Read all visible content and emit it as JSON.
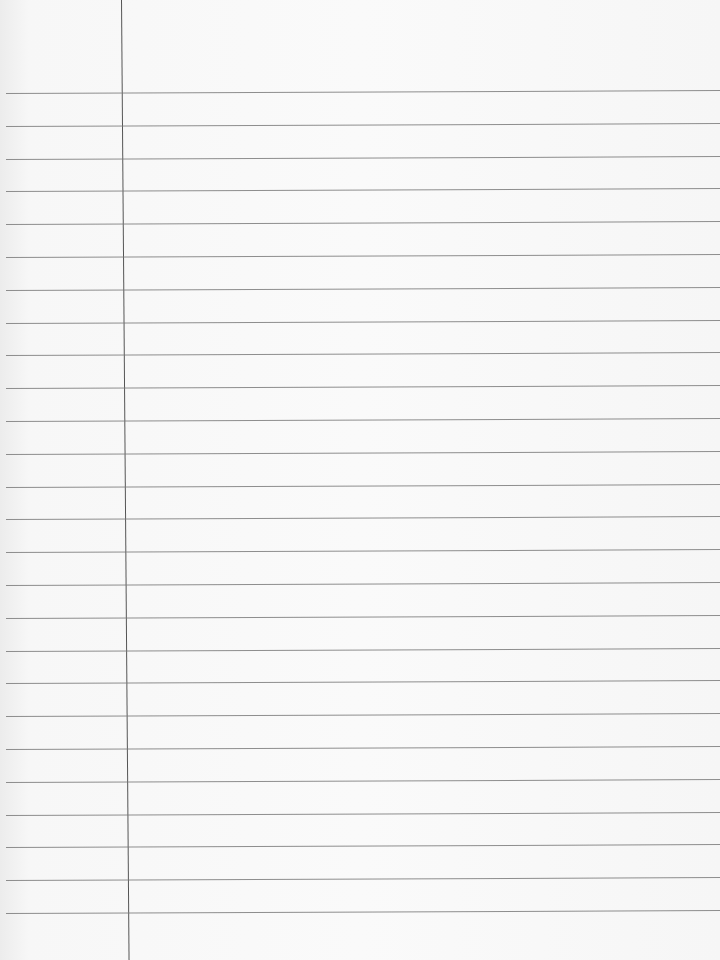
{
  "paper": {
    "type": "lined notebook paper",
    "background_color": "#fafafa",
    "rule_color": "#7a7a7a",
    "margin_color": "#555555",
    "rule_count": 26,
    "first_rule_y": 93,
    "rule_spacing": 32.8,
    "margin_x": 121
  }
}
